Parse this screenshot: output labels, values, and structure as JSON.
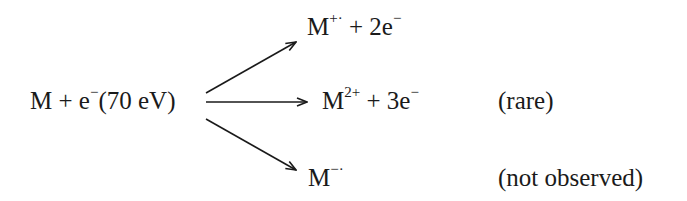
{
  "reactant": {
    "species": "M",
    "plus": "+",
    "electron": "e",
    "electron_charge": "−",
    "energy": "(70 eV)"
  },
  "products": [
    {
      "species": "M",
      "charge": "+·",
      "plus": "+",
      "electrons": "2e",
      "electron_charge": "−",
      "note": ""
    },
    {
      "species": "M",
      "charge": "2+",
      "plus": "+",
      "electrons": "3e",
      "electron_charge": "−",
      "note": "(rare)"
    },
    {
      "species": "M",
      "charge": "−·",
      "plus": "",
      "electrons": "",
      "electron_charge": "",
      "note": "(not observed)"
    }
  ],
  "colors": {
    "ink": "#1a1a1a",
    "background": "#ffffff"
  }
}
